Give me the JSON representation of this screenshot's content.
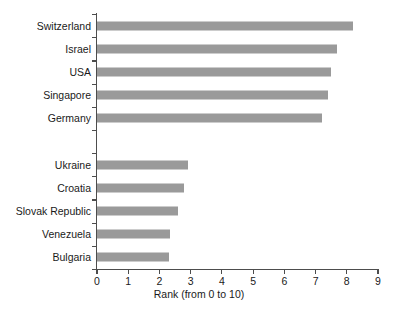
{
  "chart_data": {
    "type": "bar",
    "orientation": "horizontal",
    "title": "",
    "xlabel": "Rank (from 0 to 10)",
    "ylabel": "",
    "xlim": [
      0,
      9
    ],
    "xticks": [
      0,
      1,
      2,
      3,
      4,
      5,
      6,
      7,
      8,
      9
    ],
    "xticklabels": [
      "0",
      "1",
      "2",
      "3",
      "4",
      "5",
      "6",
      "7",
      "8",
      "9"
    ],
    "grid": false,
    "legend": false,
    "bar_color": "#9a9a9a",
    "axis_color": "#4d4d4d",
    "background_color": "#ffffff",
    "categories": [
      "Switzerland",
      "Israel",
      "USA",
      "Singapore",
      "Germany",
      "",
      "Ukraine",
      "Croatia",
      "Slovak Republic",
      "Venezuela",
      "Bulgaria"
    ],
    "values": [
      8.2,
      7.7,
      7.5,
      7.4,
      7.2,
      null,
      2.9,
      2.8,
      2.6,
      2.35,
      2.3
    ]
  }
}
